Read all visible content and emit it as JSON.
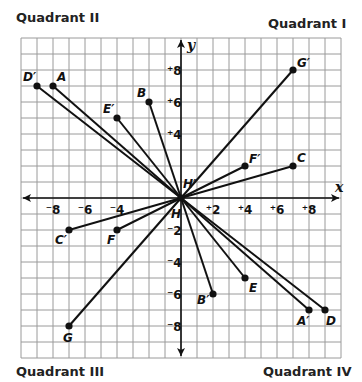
{
  "quadrants": {
    "q1": "Quadrant I",
    "q2": "Quadrant II",
    "q3": "Quadrant III",
    "q4": "Quadrant IV"
  },
  "axes": {
    "x_label": "x",
    "y_label": "y",
    "x_ticks": [
      {
        "value": -8,
        "label": "⁻8"
      },
      {
        "value": -6,
        "label": "⁻6"
      },
      {
        "value": -4,
        "label": "⁻4"
      },
      {
        "value": 2,
        "label": "⁺2"
      },
      {
        "value": 4,
        "label": "⁺4"
      },
      {
        "value": 6,
        "label": "⁺6"
      },
      {
        "value": 8,
        "label": "⁺8"
      }
    ],
    "y_ticks": [
      {
        "value": 8,
        "label": "⁺8"
      },
      {
        "value": 6,
        "label": "⁺6"
      },
      {
        "value": 4,
        "label": "⁺4"
      },
      {
        "value": -2,
        "label": "⁻2"
      },
      {
        "value": -4,
        "label": "⁻4"
      },
      {
        "value": -6,
        "label": "⁻6"
      },
      {
        "value": -8,
        "label": "⁻8"
      }
    ],
    "range": {
      "xmin": -10,
      "xmax": 10,
      "ymin": -10,
      "ymax": 10
    }
  },
  "origin_labels": {
    "H": "H",
    "H_prime": "H′"
  },
  "points": [
    {
      "name": "D′",
      "x": -9,
      "y": 7,
      "dx": -14,
      "dy": -5
    },
    {
      "name": "A",
      "x": -8,
      "y": 7,
      "dx": 4,
      "dy": -5
    },
    {
      "name": "B",
      "x": -2,
      "y": 6,
      "dx": -12,
      "dy": -5
    },
    {
      "name": "E′",
      "x": -4,
      "y": 5,
      "dx": -14,
      "dy": -5
    },
    {
      "name": "G′",
      "x": 7,
      "y": 8,
      "dx": 4,
      "dy": -3
    },
    {
      "name": "F′",
      "x": 4,
      "y": 2,
      "dx": 4,
      "dy": -3
    },
    {
      "name": "C",
      "x": 7,
      "y": 2,
      "dx": 4,
      "dy": -4
    },
    {
      "name": "C′",
      "x": -7,
      "y": -2,
      "dx": -14,
      "dy": 14
    },
    {
      "name": "F",
      "x": -4,
      "y": -2,
      "dx": -10,
      "dy": 14
    },
    {
      "name": "G",
      "x": -7,
      "y": -8,
      "dx": -6,
      "dy": 16
    },
    {
      "name": "B′",
      "x": 2,
      "y": -6,
      "dx": -16,
      "dy": 10
    },
    {
      "name": "E",
      "x": 4,
      "y": -5,
      "dx": 4,
      "dy": 14
    },
    {
      "name": "A′",
      "x": 8,
      "y": -7,
      "dx": -12,
      "dy": 15
    },
    {
      "name": "D",
      "x": 9,
      "y": -7,
      "dx": 1,
      "dy": 15
    }
  ],
  "segments": [
    [
      "D′",
      "D"
    ],
    [
      "A",
      "A′"
    ],
    [
      "B",
      "B′"
    ],
    [
      "E′",
      "E"
    ],
    [
      "G",
      "G′"
    ],
    [
      "C′",
      "C"
    ],
    [
      "F",
      "F′"
    ]
  ],
  "colors": {
    "grid": "#9a9a9a",
    "axis": "#111111",
    "line": "#111111",
    "point": "#111111"
  }
}
